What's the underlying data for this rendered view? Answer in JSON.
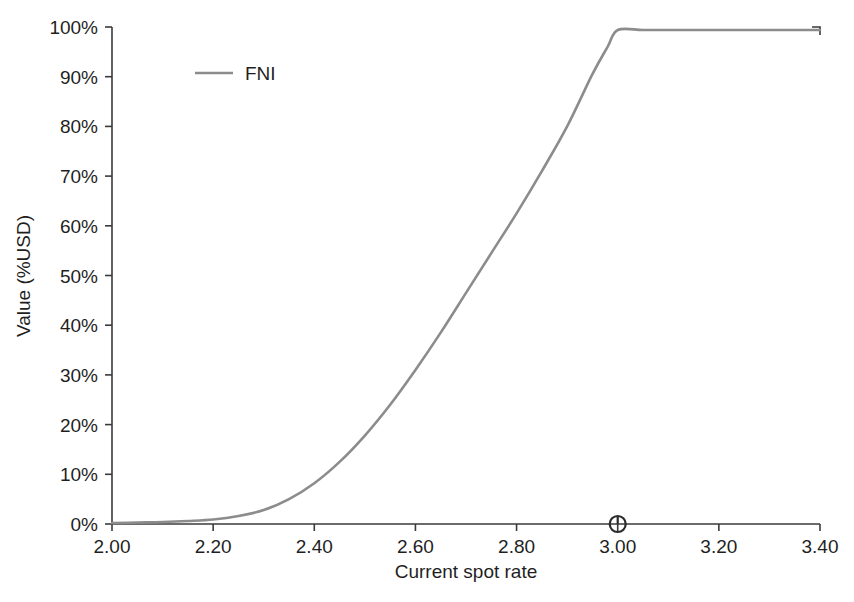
{
  "chart_data": {
    "type": "line",
    "title": "",
    "subtitle": "",
    "xlabel": "Current spot rate",
    "ylabel": "Value (%USD)",
    "xlim": [
      2.0,
      3.4
    ],
    "ylim": [
      0,
      100
    ],
    "grid": false,
    "legend_position": "top-left",
    "xticks": [
      "2.00",
      "2.20",
      "2.40",
      "2.60",
      "2.80",
      "3.00",
      "3.20",
      "3.40"
    ],
    "xtick_values": [
      2.0,
      2.2,
      2.4,
      2.6,
      2.8,
      3.0,
      3.2,
      3.4
    ],
    "yticks": [
      "0%",
      "10%",
      "20%",
      "30%",
      "40%",
      "50%",
      "60%",
      "70%",
      "80%",
      "90%",
      "100%"
    ],
    "ytick_values": [
      0,
      10,
      20,
      30,
      40,
      50,
      60,
      70,
      80,
      90,
      100
    ],
    "series": [
      {
        "name": "FNI",
        "color": "#8c8c8c",
        "x": [
          2.0,
          2.05,
          2.1,
          2.15,
          2.2,
          2.25,
          2.3,
          2.35,
          2.4,
          2.45,
          2.5,
          2.55,
          2.6,
          2.65,
          2.7,
          2.75,
          2.8,
          2.85,
          2.9,
          2.95,
          2.98,
          3.0,
          3.05,
          3.1,
          3.2,
          3.3,
          3.4
        ],
        "values": [
          0.2,
          0.3,
          0.4,
          0.6,
          0.9,
          1.6,
          2.8,
          5.0,
          8.2,
          12.5,
          17.8,
          24.0,
          31.0,
          38.5,
          46.5,
          54.5,
          62.5,
          71.0,
          80.0,
          90.5,
          96.0,
          99.4,
          99.4,
          99.4,
          99.4,
          99.4,
          99.4
        ]
      }
    ],
    "markers": [
      {
        "name": "spot-marker",
        "shape": "circle",
        "x": 3.0,
        "y": 0,
        "color": "#2b2b2b"
      }
    ],
    "legend": [
      {
        "label": "FNI",
        "color": "#8c8c8c"
      }
    ]
  }
}
